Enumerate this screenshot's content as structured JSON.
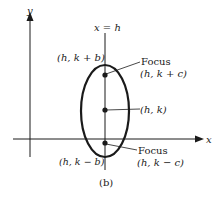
{
  "figure": {
    "caption": "(b)",
    "axes": {
      "x_label": "x",
      "y_label": "y"
    },
    "axis_line_label": "x = h",
    "points": {
      "top_vertex": "(h, k + b)",
      "bottom_vertex": "(h, k − b)",
      "center": "(h, k)",
      "upper_focus_title": "Focus",
      "upper_focus_coords": "(h, k + c)",
      "lower_focus_title": "Focus",
      "lower_focus_coords": "(h, k − c)"
    },
    "colors": {
      "ink": "#1a1a1a",
      "background": "#ffffff"
    }
  }
}
